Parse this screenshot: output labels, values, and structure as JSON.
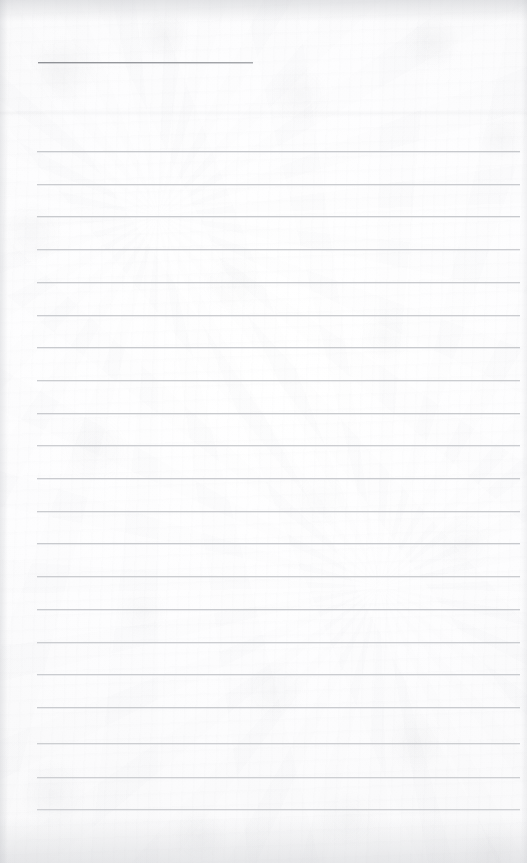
{
  "document": {
    "kind": "scanned-ruled-notebook-page",
    "title": "Blank Ruled Notebook Page",
    "page_width": 527,
    "page_height": 863,
    "paper_color": "#fdfdfd",
    "has_visible_text": false,
    "text_content": "",
    "rule_color": "#c3c5c9",
    "accent_rule_color": "#9a9ca1",
    "shadow_color": "#babcc1"
  },
  "layout": {
    "content_left": 37,
    "content_right": 520,
    "first_rule_y": 151,
    "rule_spacing": 32.7,
    "rule_count": 21,
    "rule_thickness": 1
  },
  "marks": {
    "short_rule": {
      "name": "short-top-rule",
      "x": 38,
      "y": 62,
      "width": 215,
      "thickness": 1,
      "color": "#9a9ca1"
    },
    "fold_band": {
      "name": "horizontal-fold-band",
      "y": 110,
      "height": 7,
      "opacity": 0.3
    }
  },
  "rules": [
    {
      "index": 1,
      "y": 151.0,
      "x1": 37,
      "x2": 520,
      "opacity": 0.92
    },
    {
      "index": 2,
      "y": 183.7,
      "x1": 37,
      "x2": 520,
      "opacity": 0.86
    },
    {
      "index": 3,
      "y": 216.4,
      "x1": 37,
      "x2": 520,
      "opacity": 0.9
    },
    {
      "index": 4,
      "y": 249.1,
      "x1": 37,
      "x2": 520,
      "opacity": 0.84
    },
    {
      "index": 5,
      "y": 281.8,
      "x1": 37,
      "x2": 520,
      "opacity": 0.88
    },
    {
      "index": 6,
      "y": 314.5,
      "x1": 37,
      "x2": 520,
      "opacity": 0.86
    },
    {
      "index": 7,
      "y": 347.2,
      "x1": 37,
      "x2": 520,
      "opacity": 0.9
    },
    {
      "index": 8,
      "y": 379.9,
      "x1": 37,
      "x2": 520,
      "opacity": 0.85
    },
    {
      "index": 9,
      "y": 412.6,
      "x1": 37,
      "x2": 520,
      "opacity": 0.89
    },
    {
      "index": 10,
      "y": 445.3,
      "x1": 37,
      "x2": 520,
      "opacity": 0.84
    },
    {
      "index": 11,
      "y": 478.0,
      "x1": 37,
      "x2": 520,
      "opacity": 0.88
    },
    {
      "index": 12,
      "y": 510.7,
      "x1": 37,
      "x2": 520,
      "opacity": 0.87
    },
    {
      "index": 13,
      "y": 543.4,
      "x1": 37,
      "x2": 520,
      "opacity": 0.9
    },
    {
      "index": 14,
      "y": 576.1,
      "x1": 37,
      "x2": 520,
      "opacity": 0.85
    },
    {
      "index": 15,
      "y": 608.8,
      "x1": 37,
      "x2": 520,
      "opacity": 0.88
    },
    {
      "index": 16,
      "y": 641.5,
      "x1": 37,
      "x2": 520,
      "opacity": 0.84
    },
    {
      "index": 17,
      "y": 674.2,
      "x1": 37,
      "x2": 520,
      "opacity": 0.86
    },
    {
      "index": 18,
      "y": 706.9,
      "x1": 37,
      "x2": 520,
      "opacity": 0.88
    },
    {
      "index": 19,
      "y": 743.0,
      "x1": 37,
      "x2": 520,
      "opacity": 0.82
    },
    {
      "index": 20,
      "y": 776.5,
      "x1": 37,
      "x2": 520,
      "opacity": 0.8
    },
    {
      "index": 21,
      "y": 809.0,
      "x1": 37,
      "x2": 520,
      "opacity": 0.78
    }
  ]
}
